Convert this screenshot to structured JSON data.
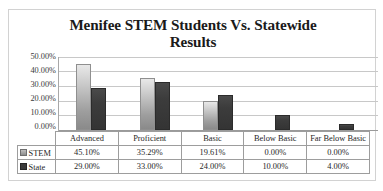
{
  "chart_data": {
    "type": "bar",
    "title": "Menifee STEM Students Vs. Statewide Results",
    "title_line1": "Menifee STEM Students Vs. Statewide",
    "title_line2": "Results",
    "xlabel": "",
    "ylabel": "",
    "ylim": [
      0,
      50
    ],
    "ytick_labels": [
      "50.00%",
      "40.00%",
      "30.00%",
      "20.00%",
      "10.00%",
      "0.00%"
    ],
    "ytick_values": [
      50,
      40,
      30,
      20,
      10,
      0
    ],
    "grid": true,
    "legend_position": "data-table-row-labels",
    "categories": [
      "Advanced",
      "Proficient",
      "Basic",
      "Below Basic",
      "Far Below Basic"
    ],
    "series": [
      {
        "name": "STEM",
        "color": "#b0b0b0",
        "values": [
          45.1,
          35.29,
          19.61,
          0.0,
          0.0
        ],
        "labels": [
          "45.10%",
          "35.29%",
          "19.61%",
          "0.00%",
          "0.00%"
        ]
      },
      {
        "name": "State",
        "color": "#3a3a3a",
        "values": [
          29.0,
          33.0,
          24.0,
          10.0,
          4.0
        ],
        "labels": [
          "29.00%",
          "33.00%",
          "24.00%",
          "10.00%",
          "4.00%"
        ]
      }
    ]
  },
  "table": {
    "corner_label": "",
    "column_headers": [
      "Advanced",
      "Proficient",
      "Basic",
      "Below Basic",
      "Far Below Basic"
    ],
    "rows": [
      {
        "label": "STEM",
        "swatch": "series-stem-swatch",
        "cells": [
          "45.10%",
          "35.29%",
          "19.61%",
          "0.00%",
          "0.00%"
        ]
      },
      {
        "label": "State",
        "swatch": "series-state-swatch",
        "cells": [
          "29.00%",
          "33.00%",
          "24.00%",
          "10.00%",
          "4.00%"
        ]
      }
    ]
  },
  "colors": {
    "frame_border": "#d2d2d2",
    "gridline": "#c8c8c8",
    "axis": "#9a9a9a",
    "table_border": "#9d9d9d",
    "text": "#1f1f1f",
    "title_text": "#1a1a1a"
  }
}
